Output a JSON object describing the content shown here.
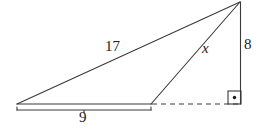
{
  "figure": {
    "kind": "geometry-diagram",
    "background_color": "#ffffff",
    "stroke_color": "#3a3a3a",
    "text_color": "#1a1a1a",
    "canvas": {
      "width": 265,
      "height": 129
    },
    "labels": {
      "hypotenuse": "17",
      "cevian": "x",
      "vertical_leg": "8",
      "base_segment": "9"
    },
    "vertices": {
      "left": {
        "x": 17,
        "y": 104
      },
      "apex": {
        "x": 240,
        "y": 2
      },
      "right_angle": {
        "x": 240,
        "y": 104
      },
      "foot": {
        "x": 151,
        "y": 104
      }
    },
    "segments": [
      {
        "name": "hypotenuse-17",
        "from": [
          17,
          104
        ],
        "to": [
          240,
          2
        ],
        "style": "solid"
      },
      {
        "name": "cevian-x",
        "from": [
          151,
          104
        ],
        "to": [
          240,
          2
        ],
        "style": "solid"
      },
      {
        "name": "base-9",
        "from": [
          17,
          104
        ],
        "to": [
          151,
          104
        ],
        "style": "solid"
      },
      {
        "name": "base-extension",
        "from": [
          151,
          104
        ],
        "to": [
          240,
          104
        ],
        "style": "dashed"
      },
      {
        "name": "vertical-leg-8",
        "from": [
          240,
          2
        ],
        "to": [
          240,
          104
        ],
        "style": "solid"
      }
    ],
    "brace": {
      "from": [
        17,
        110
      ],
      "to": [
        151,
        110
      ],
      "tick_x": 84,
      "tick_depth": 3
    },
    "right_angle_marker": {
      "x": 228,
      "y": 91,
      "size": 13,
      "dot_radius": 1.6
    }
  }
}
